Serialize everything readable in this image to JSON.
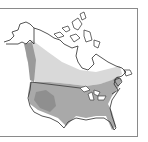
{
  "map": {
    "type": "species-range-map",
    "region": "North America",
    "legend": [],
    "colors": {
      "background": "#ffffff",
      "frame": "#8a8a8a",
      "outline": "#2a2a2a",
      "range_light": "#d6d6d6",
      "range_medium": "#a8a8a8",
      "range_dark": "#8e8e8e",
      "land_unshaded": "#ffffff"
    }
  }
}
